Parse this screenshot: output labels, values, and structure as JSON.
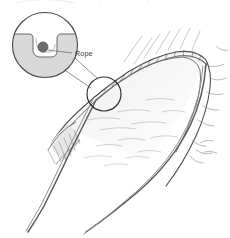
{
  "figure": {
    "type": "line-art-illustration",
    "background_color": "#ffffff",
    "canvas": {
      "width": 230,
      "height": 238
    }
  },
  "labels": {
    "rope": "Rope"
  },
  "colors": {
    "ink": "#3c3c3c",
    "ink_light": "#8e8e8e",
    "ink_faint": "#b4b4b4",
    "rope_stroke": "#5a5a5a",
    "rope_core": "#6e6e6e",
    "inset_fill": "#d9d9d9",
    "inset_stroke": "#4a4a4a",
    "rock_shade": "#e9e9e9",
    "leader_line": "#6e6e6e",
    "background": "#ffffff"
  },
  "elements": {
    "inset_circle": {
      "name": "magnified cross-section of rope in rock notch",
      "center_x": 45,
      "center_y": 45,
      "radius": 33,
      "fill": "#d9d9d9",
      "contents": "rope cross-section seated in a V notch groove cut into rock"
    },
    "rope_cross_section": {
      "center_x": 43,
      "center_y": 47,
      "radius": 5,
      "fill": "#6e6e6e"
    },
    "detail_circle": {
      "name": "callout circle on ridge marking magnified area",
      "center_x": 104,
      "center_y": 94,
      "radius": 17,
      "stroke": "#2b2b2b"
    },
    "leader_lines": [
      {
        "from_x": 62,
        "from_y": 70,
        "to_x": 92,
        "to_y": 88
      },
      {
        "from_x": 74,
        "from_y": 58,
        "to_x": 97,
        "to_y": 80
      }
    ],
    "rope_strands": {
      "count": 2,
      "description": "two rope strands descending from the ridge crest toward lower left and lower center"
    },
    "ridge": {
      "description": "arched rock ridge running from lower-left up over the top and down the right side",
      "crest_hatching": true
    }
  }
}
